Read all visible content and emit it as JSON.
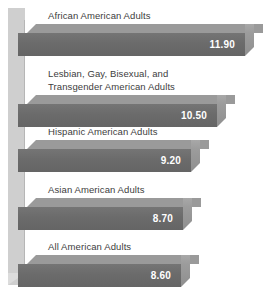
{
  "chart_data": {
    "type": "bar",
    "orientation": "horizontal",
    "title": "",
    "xlabel": "",
    "ylabel": "",
    "grid": false,
    "legend": null,
    "categories": [
      "African American Adults",
      "Lesbian, Gay, Bisexual, and\nTransgender American Adults",
      "Hispanic American Adults",
      "Asian American Adults",
      "All American Adults"
    ],
    "values": [
      11.9,
      10.5,
      9.2,
      8.7,
      8.6
    ],
    "value_labels": [
      "11.90",
      "10.50",
      "9.20",
      "8.70",
      "8.60"
    ],
    "xlim": [
      0,
      12.4
    ]
  },
  "style": {
    "bar_front_color": "#6b6b6b",
    "bar_top_color": "#9a9a9a",
    "bar_cap_color": "#9c9c9c",
    "axis_wall_color": "#cfcfcf",
    "label_color": "#3d3d3d",
    "value_color": "#ffffff",
    "background_color": "#ffffff"
  },
  "bars": [
    {
      "label": "African American Adults",
      "value_label": "11.90",
      "value": 11.9,
      "label_top": 10,
      "bar_top": 24,
      "bar_width": 227
    },
    {
      "label": "Lesbian, Gay, Bisexual, and\nTransgender American Adults",
      "value_label": "10.50",
      "value": 10.5,
      "label_top": 68,
      "bar_top": 95,
      "bar_width": 199
    },
    {
      "label": "Hispanic American Adults",
      "value_label": "9.20",
      "value": 9.2,
      "label_top": 126,
      "bar_top": 140,
      "bar_width": 173
    },
    {
      "label": "Asian American Adults",
      "value_label": "8.70",
      "value": 8.7,
      "label_top": 184,
      "bar_top": 198,
      "bar_width": 165
    },
    {
      "label": "All American Adults",
      "value_label": "8.60",
      "value": 8.6,
      "label_top": 241,
      "bar_top": 255,
      "bar_width": 163
    }
  ]
}
